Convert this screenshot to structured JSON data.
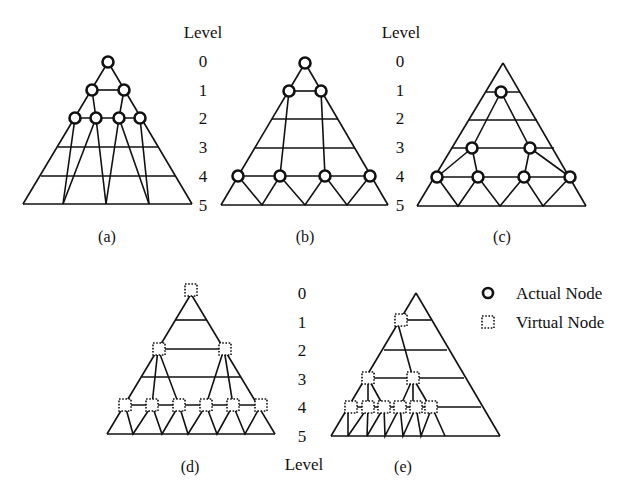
{
  "figure": {
    "level_header": "Level",
    "levels": [
      "0",
      "1",
      "2",
      "3",
      "4",
      "5"
    ],
    "legend": {
      "actual": "Actual Node",
      "virtual": "Virtual Node"
    },
    "panels": [
      {
        "id": "a",
        "caption": "(a)"
      },
      {
        "id": "b",
        "caption": "(b)"
      },
      {
        "id": "c",
        "caption": "(c)"
      },
      {
        "id": "d",
        "caption": "(d)"
      },
      {
        "id": "e",
        "caption": "(e)"
      }
    ]
  },
  "colors": {
    "ink": "#111111",
    "background": "#ffffff"
  }
}
